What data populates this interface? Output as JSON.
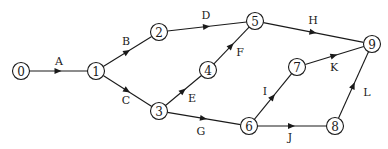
{
  "diagram": {
    "type": "activity-on-arrow network",
    "node_radius": 8.5,
    "nodes": [
      {
        "id": "0",
        "label": "0",
        "x": 21,
        "y": 71
      },
      {
        "id": "1",
        "label": "1",
        "x": 96,
        "y": 71
      },
      {
        "id": "2",
        "label": "2",
        "x": 159,
        "y": 32
      },
      {
        "id": "3",
        "label": "3",
        "x": 159,
        "y": 111
      },
      {
        "id": "4",
        "label": "4",
        "x": 208,
        "y": 70
      },
      {
        "id": "5",
        "label": "5",
        "x": 255,
        "y": 21
      },
      {
        "id": "6",
        "label": "6",
        "x": 249,
        "y": 126
      },
      {
        "id": "7",
        "label": "7",
        "x": 297,
        "y": 67
      },
      {
        "id": "8",
        "label": "8",
        "x": 335,
        "y": 126
      },
      {
        "id": "9",
        "label": "9",
        "x": 372,
        "y": 44
      }
    ],
    "edges": [
      {
        "label": "A",
        "from": "0",
        "to": "1",
        "lx": 59,
        "ly": 61
      },
      {
        "label": "B",
        "from": "1",
        "to": "2",
        "lx": 126,
        "ly": 41
      },
      {
        "label": "C",
        "from": "1",
        "to": "3",
        "lx": 126,
        "ly": 100
      },
      {
        "label": "D",
        "from": "2",
        "to": "5",
        "lx": 206,
        "ly": 15
      },
      {
        "label": "E",
        "from": "3",
        "to": "4",
        "lx": 192,
        "ly": 98
      },
      {
        "label": "F",
        "from": "4",
        "to": "5",
        "lx": 240,
        "ly": 52
      },
      {
        "label": "G",
        "from": "3",
        "to": "6",
        "lx": 201,
        "ly": 131
      },
      {
        "label": "H",
        "from": "5",
        "to": "9",
        "lx": 313,
        "ly": 20
      },
      {
        "label": "I",
        "from": "6",
        "to": "7",
        "lx": 265,
        "ly": 91
      },
      {
        "label": "J",
        "from": "6",
        "to": "8",
        "lx": 290,
        "ly": 137
      },
      {
        "label": "K",
        "from": "7",
        "to": "9",
        "lx": 334,
        "ly": 67
      },
      {
        "label": "L",
        "from": "8",
        "to": "9",
        "lx": 367,
        "ly": 92
      }
    ]
  }
}
